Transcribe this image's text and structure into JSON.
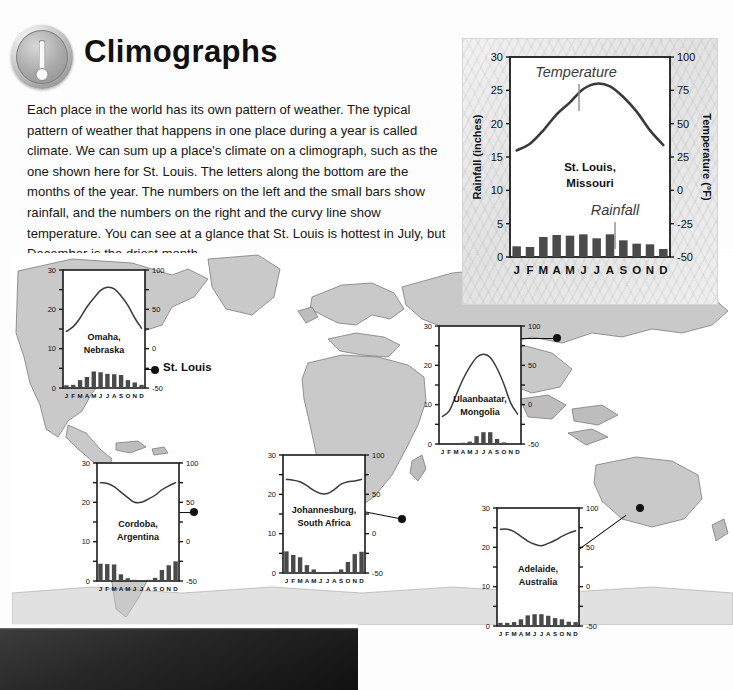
{
  "header": {
    "title": "Climographs",
    "icon": "thermometer-badge-icon",
    "body": "Each place in the world has its own pattern of weather. The typical pattern of weather that happens in one place during a year is called climate. We can sum up a place's climate on a climograph, such as the one shown here for St. Louis. The letters along the bottom are the months of the year. The numbers on the left and the small bars show rainfall, and the numbers on the right and the curvy line show temperature. You can see at a glance that St. Louis is hottest in July, but December is the driest month."
  },
  "map": {
    "label": "world-map",
    "city_marker_label": "St. Louis",
    "land_color": "#c9c9c9",
    "ocean_color": "#ffffff"
  },
  "axes": {
    "months": [
      "J",
      "F",
      "M",
      "A",
      "M",
      "J",
      "J",
      "A",
      "S",
      "O",
      "N",
      "D"
    ],
    "rainfall_label": "Rainfall (inches)",
    "temperature_label": "Temperature (°F)",
    "rainfall_ticks": [
      0,
      5,
      10,
      15,
      20,
      25,
      30
    ],
    "rainfall_ticks_small": [
      0,
      10,
      20,
      30
    ],
    "temperature_ticks": [
      -50,
      -25,
      0,
      25,
      50,
      75,
      100
    ],
    "temperature_ticks_small": [
      -50,
      0,
      50,
      100
    ],
    "rainfall_range": [
      0,
      30
    ],
    "temperature_range": [
      -50,
      100
    ]
  },
  "chart_data": [
    {
      "id": "st-louis",
      "type": "bar",
      "title": "St. Louis, Missouri",
      "place_line1": "St. Louis,",
      "place_line2": "Missouri",
      "categories": [
        "J",
        "F",
        "M",
        "A",
        "M",
        "J",
        "J",
        "A",
        "S",
        "O",
        "N",
        "D"
      ],
      "xlabel": "",
      "ylabel": "Rainfall (inches)",
      "ylabel_right": "Temperature (°F)",
      "ylim": [
        0,
        30
      ],
      "ylim_right": [
        -50,
        100
      ],
      "grid": false,
      "annotations": [
        {
          "text": "Temperature",
          "target": "temperature-curve"
        },
        {
          "text": "Rainfall",
          "target": "rainfall-bars"
        }
      ],
      "series": [
        {
          "name": "Rainfall",
          "unit": "inches",
          "type": "bar",
          "values": [
            1.6,
            1.5,
            3.0,
            3.3,
            3.2,
            3.4,
            2.8,
            3.4,
            2.5,
            2.0,
            1.9,
            1.2
          ]
        },
        {
          "name": "Temperature",
          "unit": "°F",
          "type": "line",
          "values": [
            30,
            35,
            45,
            57,
            66,
            76,
            80,
            78,
            70,
            59,
            45,
            34
          ]
        }
      ]
    },
    {
      "id": "omaha",
      "type": "bar",
      "title": "Omaha, Nebraska",
      "place_line1": "Omaha,",
      "place_line2": "Nebraska",
      "categories": [
        "J",
        "F",
        "M",
        "A",
        "M",
        "J",
        "J",
        "A",
        "S",
        "O",
        "N",
        "D"
      ],
      "ylim": [
        0,
        30
      ],
      "ylim_right": [
        -50,
        100
      ],
      "series": [
        {
          "name": "Rainfall",
          "unit": "inches",
          "type": "bar",
          "values": [
            0.7,
            0.8,
            2.0,
            2.8,
            4.2,
            4.0,
            3.6,
            3.5,
            3.3,
            2.0,
            1.4,
            0.8
          ]
        },
        {
          "name": "Temperature",
          "unit": "°F",
          "type": "line",
          "values": [
            22,
            28,
            39,
            53,
            64,
            74,
            78,
            76,
            67,
            55,
            39,
            26
          ]
        }
      ]
    },
    {
      "id": "ulaanbaatar",
      "type": "bar",
      "title": "Ulaanbaatar, Mongolia",
      "place_line1": "Ulaanbaatar,",
      "place_line2": "Mongolia",
      "categories": [
        "J",
        "F",
        "M",
        "A",
        "M",
        "J",
        "J",
        "A",
        "S",
        "O",
        "N",
        "D"
      ],
      "ylim": [
        0,
        30
      ],
      "ylim_right": [
        -50,
        100
      ],
      "series": [
        {
          "name": "Rainfall",
          "unit": "inches",
          "type": "bar",
          "values": [
            0.1,
            0.1,
            0.2,
            0.3,
            0.6,
            2.0,
            3.0,
            3.0,
            1.3,
            0.4,
            0.2,
            0.1
          ]
        },
        {
          "name": "Temperature",
          "unit": "°F",
          "type": "line",
          "values": [
            -15,
            -8,
            12,
            32,
            48,
            60,
            64,
            60,
            46,
            26,
            2,
            -12
          ]
        }
      ]
    },
    {
      "id": "cordoba",
      "type": "bar",
      "title": "Cordoba, Argentina",
      "place_line1": "Cordoba,",
      "place_line2": "Argentina",
      "categories": [
        "J",
        "F",
        "M",
        "A",
        "M",
        "J",
        "J",
        "A",
        "S",
        "O",
        "N",
        "D"
      ],
      "ylim": [
        0,
        30
      ],
      "ylim_right": [
        -50,
        100
      ],
      "series": [
        {
          "name": "Rainfall",
          "unit": "inches",
          "type": "bar",
          "values": [
            4.4,
            4.3,
            4.2,
            1.7,
            0.7,
            0.3,
            0.2,
            0.3,
            0.8,
            2.8,
            4.0,
            5.0
          ]
        },
        {
          "name": "Temperature",
          "unit": "°F",
          "type": "line",
          "values": [
            75,
            74,
            70,
            63,
            56,
            50,
            50,
            54,
            59,
            66,
            71,
            75
          ]
        }
      ]
    },
    {
      "id": "johannesburg",
      "type": "bar",
      "title": "Johannesburg, South Africa",
      "place_line1": "Johannesburg,",
      "place_line2": "South Africa",
      "categories": [
        "J",
        "F",
        "M",
        "A",
        "M",
        "J",
        "J",
        "A",
        "S",
        "O",
        "N",
        "D"
      ],
      "ylim": [
        0,
        30
      ],
      "ylim_right": [
        -50,
        100
      ],
      "series": [
        {
          "name": "Rainfall",
          "unit": "inches",
          "type": "bar",
          "values": [
            5.5,
            4.6,
            4.0,
            2.0,
            0.9,
            0.2,
            0.2,
            0.3,
            0.9,
            2.8,
            4.8,
            5.4
          ]
        },
        {
          "name": "Temperature",
          "unit": "°F",
          "type": "line",
          "values": [
            69,
            68,
            66,
            61,
            55,
            51,
            51,
            56,
            63,
            66,
            67,
            69
          ]
        }
      ]
    },
    {
      "id": "adelaide",
      "type": "bar",
      "title": "Adelaide, Australia",
      "place_line1": "Adelaide,",
      "place_line2": "Australia",
      "categories": [
        "J",
        "F",
        "M",
        "A",
        "M",
        "J",
        "J",
        "A",
        "S",
        "O",
        "N",
        "D"
      ],
      "ylim": [
        0,
        30
      ],
      "ylim_right": [
        -50,
        100
      ],
      "series": [
        {
          "name": "Rainfall",
          "unit": "inches",
          "type": "bar",
          "values": [
            0.8,
            0.8,
            1.0,
            1.7,
            2.7,
            3.0,
            3.0,
            2.6,
            2.0,
            1.7,
            1.1,
            1.0
          ]
        },
        {
          "name": "Temperature",
          "unit": "°F",
          "type": "line",
          "values": [
            73,
            73,
            70,
            64,
            58,
            54,
            52,
            55,
            59,
            64,
            68,
            71
          ]
        }
      ]
    }
  ],
  "callouts": [
    {
      "id": "omaha",
      "city": "Omaha"
    },
    {
      "id": "stlouis-map-label",
      "city": "St. Louis"
    },
    {
      "id": "ulaanbaatar",
      "city": "Ulaanbaatar"
    },
    {
      "id": "cordoba",
      "city": "Cordoba"
    },
    {
      "id": "johannesburg",
      "city": "Johannesburg"
    },
    {
      "id": "adelaide",
      "city": "Adelaide"
    }
  ]
}
